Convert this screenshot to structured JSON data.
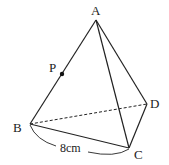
{
  "figure": {
    "type": "triangular pyramid (tetrahedron)",
    "vertices": {
      "A": {
        "label": "A",
        "x": 96,
        "y": 20
      },
      "B": {
        "label": "B",
        "x": 30,
        "y": 124
      },
      "C": {
        "label": "C",
        "x": 129,
        "y": 148
      },
      "D": {
        "label": "D",
        "x": 147,
        "y": 104
      }
    },
    "point_P": {
      "label": "P",
      "on_edge": "AB",
      "x": 62,
      "y": 74
    },
    "edges_solid": [
      "AB",
      "AC",
      "AD",
      "BC",
      "CD"
    ],
    "edges_dashed": [
      "BD"
    ],
    "measurement": {
      "edge": "BC",
      "text": "8cm"
    }
  }
}
